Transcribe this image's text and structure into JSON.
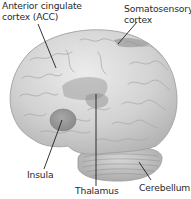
{
  "figure": {
    "type": "anatomical-illustration",
    "colors": {
      "background": "#ffffff",
      "brain_fill": "#cfcfcf",
      "brain_highlight": "#e6e6e6",
      "sulcus_lines": "#a9a9a9",
      "highlighted_regions": "#9e9e9e",
      "leader_lines": "#1e1e1e",
      "label_text": "#2a2a2a"
    }
  },
  "labels": {
    "acc": {
      "line1": "Anterior cingulate",
      "line2": "cortex (ACC)"
    },
    "somatosensory": {
      "line1": "Somatosensory",
      "line2": "cortex"
    },
    "insula": {
      "text": "Insula"
    },
    "thalamus": {
      "text": "Thalamus"
    },
    "cerebellum": {
      "text": "Cerebellum"
    }
  }
}
